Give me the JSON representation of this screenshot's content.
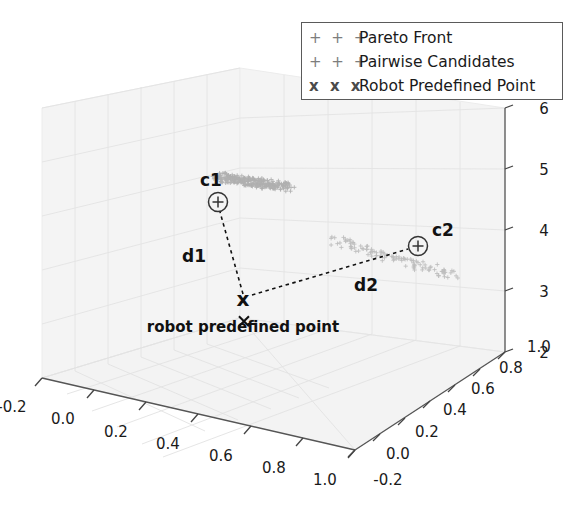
{
  "chart_data": {
    "type": "scatter",
    "projection": "3d",
    "title": "",
    "xlabel": "",
    "ylabel": "",
    "zlabel": "",
    "xticks": [
      "-0.2",
      "0.0",
      "0.2",
      "0.4",
      "0.6",
      "0.8",
      "1.0"
    ],
    "yticks": [
      "-0.2",
      "0.0",
      "0.2",
      "0.4",
      "0.6",
      "0.8",
      "1.0"
    ],
    "zticks": [
      "2",
      "3",
      "4",
      "5",
      "6"
    ],
    "xlim": [
      -0.2,
      1.0
    ],
    "ylim": [
      -0.2,
      1.0
    ],
    "zlim": [
      2,
      6
    ],
    "grid": true,
    "pane_color": "#f2f2f2",
    "grid_color": "#e0e0e0",
    "series": [
      {
        "name": "Pareto Front",
        "marker": "+",
        "color": "#b0b0b0",
        "points": [
          [
            0.075,
            0.3,
            5.22
          ],
          [
            0.085,
            0.31,
            5.21
          ],
          [
            0.095,
            0.305,
            5.2
          ],
          [
            0.105,
            0.315,
            5.19
          ],
          [
            0.115,
            0.31,
            5.18
          ],
          [
            0.125,
            0.32,
            5.17
          ],
          [
            0.135,
            0.318,
            5.16
          ],
          [
            0.145,
            0.325,
            5.15
          ],
          [
            0.155,
            0.322,
            5.14
          ],
          [
            0.165,
            0.33,
            5.13
          ],
          [
            0.175,
            0.328,
            5.12
          ],
          [
            0.185,
            0.335,
            5.11
          ],
          [
            0.195,
            0.332,
            5.1
          ],
          [
            0.205,
            0.34,
            5.09
          ],
          [
            0.215,
            0.338,
            5.08
          ],
          [
            0.225,
            0.345,
            5.07
          ],
          [
            0.235,
            0.342,
            5.06
          ],
          [
            0.245,
            0.35,
            5.05
          ],
          [
            0.255,
            0.348,
            5.04
          ],
          [
            0.265,
            0.355,
            5.03
          ],
          [
            0.275,
            0.352,
            5.02
          ],
          [
            0.285,
            0.36,
            5.01
          ],
          [
            0.295,
            0.358,
            5.0
          ],
          [
            0.305,
            0.365,
            4.99
          ],
          [
            0.315,
            0.362,
            4.98
          ],
          [
            0.325,
            0.37,
            4.97
          ],
          [
            0.335,
            0.368,
            4.96
          ],
          [
            0.345,
            0.375,
            4.95
          ],
          [
            0.355,
            0.372,
            4.94
          ],
          [
            0.365,
            0.38,
            4.93
          ]
        ]
      },
      {
        "name": "Pairwise Candidates",
        "marker": "+",
        "color": "#bdbdbd",
        "points": [
          [
            0.52,
            0.48,
            4.1
          ],
          [
            0.55,
            0.5,
            4.05
          ],
          [
            0.58,
            0.52,
            4.0
          ],
          [
            0.61,
            0.54,
            3.95
          ],
          [
            0.64,
            0.56,
            3.9
          ],
          [
            0.67,
            0.58,
            3.85
          ],
          [
            0.7,
            0.6,
            3.8
          ],
          [
            0.73,
            0.62,
            3.75
          ],
          [
            0.76,
            0.64,
            3.7
          ],
          [
            0.79,
            0.66,
            3.65
          ],
          [
            0.82,
            0.68,
            3.6
          ],
          [
            0.85,
            0.7,
            3.55
          ]
        ]
      },
      {
        "name": "Robot Predefined Point",
        "marker": "x",
        "color": "#111111",
        "points": [
          [
            0.36,
            0.22,
            2.8
          ]
        ]
      }
    ],
    "annotations": [
      {
        "name": "c1",
        "label": "c1",
        "marker": "circled-plus",
        "x_px": 218,
        "y_px": 202,
        "label_x_px": 211,
        "label_y_px": 184
      },
      {
        "name": "c2",
        "label": "c2",
        "marker": "circled-plus",
        "x_px": 418,
        "y_px": 246,
        "label_x_px": 440,
        "label_y_px": 236
      },
      {
        "name": "robot-point",
        "label": "x",
        "marker": "x",
        "x_px": 243,
        "y_px": 299
      },
      {
        "name": "d1",
        "label": "d1",
        "x_px": 194,
        "y_px": 256
      },
      {
        "name": "d2",
        "label": "d2",
        "x_px": 366,
        "y_px": 285
      },
      {
        "name": "robot-caption",
        "label": "robot predefined point",
        "x_px": 243,
        "y_px": 327
      }
    ]
  },
  "legend": {
    "position": "upper right",
    "entries": [
      {
        "glyph": "+ + +",
        "label": "Pareto Front"
      },
      {
        "glyph": "+ + +",
        "label": "Pairwise Candidates"
      },
      {
        "glyph": "x x x",
        "label": "Robot Predefined Point"
      }
    ]
  },
  "axes": {
    "x_ticks": [
      "-0.2",
      "0.0",
      "0.2",
      "0.4",
      "0.6",
      "0.8",
      "1.0"
    ],
    "y_ticks": [
      "-0.2",
      "0.0",
      "0.2",
      "0.4",
      "0.6",
      "0.8",
      "1.0"
    ],
    "z_ticks": [
      "2",
      "3",
      "4",
      "5",
      "6"
    ]
  },
  "annotation_text": {
    "c1": "c1",
    "c2": "c2",
    "d1": "d1",
    "d2": "d2",
    "x_marker": "x",
    "caption": "robot predefined point"
  }
}
